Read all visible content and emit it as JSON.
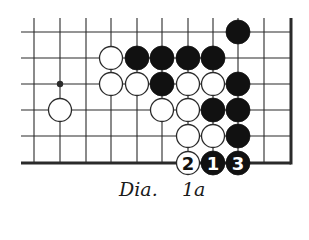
{
  "diagram": {
    "title_prefix": "Dia.",
    "title_number": "1a",
    "colors": {
      "line": "#2a2a2a",
      "black_stone": "#111111",
      "white_stone": "#ffffff",
      "stone_outline": "#2a2a2a",
      "label_on_black": "#ffffff",
      "label_on_white": "#111111"
    },
    "grid": {
      "columns_x": [
        34,
        60,
        86,
        111,
        137,
        162,
        188,
        213,
        238,
        264,
        291
      ],
      "rows_y": [
        32,
        58,
        84,
        110,
        136,
        163
      ],
      "line_left": 21,
      "line_top": 18,
      "right_edge": 291,
      "bottom_edge": 163,
      "stone_radius": 12,
      "star_points": [
        [
          1,
          2
        ]
      ]
    },
    "stones": [
      {
        "color": "black",
        "col": 8,
        "row": 0
      },
      {
        "color": "white",
        "col": 3,
        "row": 1
      },
      {
        "color": "black",
        "col": 4,
        "row": 1
      },
      {
        "color": "black",
        "col": 5,
        "row": 1
      },
      {
        "color": "black",
        "col": 6,
        "row": 1
      },
      {
        "color": "black",
        "col": 7,
        "row": 1
      },
      {
        "color": "white",
        "col": 3,
        "row": 2
      },
      {
        "color": "white",
        "col": 4,
        "row": 2
      },
      {
        "color": "black",
        "col": 5,
        "row": 2
      },
      {
        "color": "white",
        "col": 6,
        "row": 2
      },
      {
        "color": "white",
        "col": 7,
        "row": 2
      },
      {
        "color": "black",
        "col": 8,
        "row": 2
      },
      {
        "color": "white",
        "col": 1,
        "row": 3
      },
      {
        "color": "white",
        "col": 5,
        "row": 3
      },
      {
        "color": "white",
        "col": 6,
        "row": 3
      },
      {
        "color": "black",
        "col": 7,
        "row": 3
      },
      {
        "color": "black",
        "col": 8,
        "row": 3
      },
      {
        "color": "white",
        "col": 6,
        "row": 4
      },
      {
        "color": "white",
        "col": 7,
        "row": 4
      },
      {
        "color": "black",
        "col": 8,
        "row": 4
      },
      {
        "color": "white",
        "col": 6,
        "row": 5,
        "label": "2"
      },
      {
        "color": "black",
        "col": 7,
        "row": 5,
        "label": "1"
      },
      {
        "color": "black",
        "col": 8,
        "row": 5,
        "label": "3"
      }
    ]
  }
}
